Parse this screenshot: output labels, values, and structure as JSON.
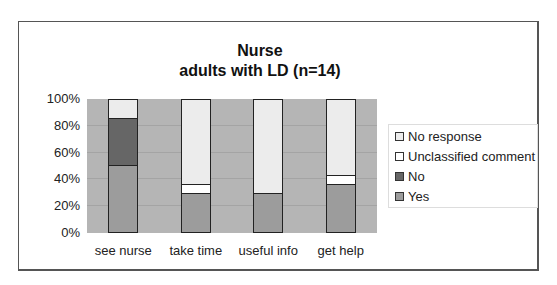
{
  "chart_data": {
    "type": "bar",
    "stacked": true,
    "percent": true,
    "title": "Nurse",
    "subtitle": "adults with LD (n=14)",
    "xlabel": "",
    "ylabel": "",
    "ylim": [
      0,
      100
    ],
    "yticks": [
      "0%",
      "20%",
      "40%",
      "60%",
      "80%",
      "100%"
    ],
    "categories": [
      "see nurse",
      "take time",
      "useful info",
      "get help"
    ],
    "series": [
      {
        "name": "Yes",
        "color": "#9c9c9c",
        "values": [
          50.0,
          28.6,
          28.6,
          35.7
        ]
      },
      {
        "name": "No",
        "color": "#666666",
        "values": [
          35.7,
          0,
          0,
          0
        ]
      },
      {
        "name": "Unclassified comment",
        "color": "#ffffff",
        "values": [
          0,
          7.1,
          0,
          7.1
        ]
      },
      {
        "name": "No response",
        "color": "#ececec",
        "values": [
          14.3,
          64.3,
          71.4,
          57.1
        ]
      }
    ],
    "legend": [
      "No response",
      "Unclassified comment",
      "No",
      "Yes"
    ],
    "legend_position": "right",
    "grid": true
  },
  "colors": {
    "plot_bg": "#b5b5b5",
    "gridline": "#a4a4a4"
  }
}
